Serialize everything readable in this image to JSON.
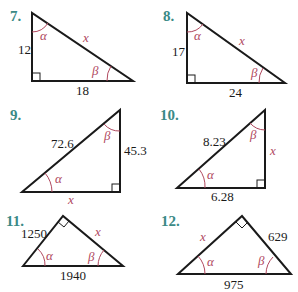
{
  "problems": [
    {
      "number": "7.",
      "sides": {
        "vertical": "12",
        "horizontal": "18",
        "hypotenuse": "x"
      },
      "angles": [
        "α",
        "β"
      ]
    },
    {
      "number": "8.",
      "sides": {
        "vertical": "17",
        "horizontal": "24",
        "hypotenuse": "x"
      },
      "angles": [
        "α",
        "β"
      ]
    },
    {
      "number": "9.",
      "sides": {
        "hypotenuse": "72.6",
        "vertical": "45.3",
        "horizontal": "x"
      },
      "angles": [
        "α",
        "β"
      ]
    },
    {
      "number": "10.",
      "sides": {
        "hypotenuse": "8.23",
        "vertical": "x",
        "horizontal": "6.28"
      },
      "angles": [
        "α",
        "β"
      ]
    },
    {
      "number": "11.",
      "sides": {
        "left": "1250",
        "right": "x",
        "base": "1940"
      },
      "angles": [
        "α",
        "β"
      ]
    },
    {
      "number": "12.",
      "sides": {
        "left": "x",
        "right": "629",
        "base": "975"
      },
      "angles": [
        "α",
        "β"
      ]
    }
  ],
  "colors": {
    "problem_number": "#3b8a86",
    "angle_label": "#b0485e",
    "lines": "#1a1a1a"
  }
}
